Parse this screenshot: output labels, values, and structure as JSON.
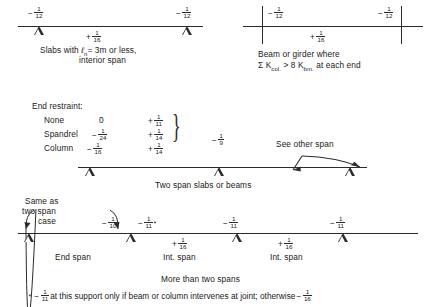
{
  "figure": {
    "type": "aci-moment-coefficient-diagram",
    "panels": [
      {
        "id": "slabs-interior",
        "caption_line1": "Slabs with ℓn = 3m or less,",
        "caption_line2": "interior span",
        "caption_italic_symbol": "ℓ",
        "caption_subscript": "n",
        "left_moment": {
          "sign": "−",
          "num": "1",
          "den": "12"
        },
        "right_moment": {
          "sign": "−",
          "num": "1",
          "den": "12"
        },
        "mid_moment": {
          "sign": "+",
          "num": "1",
          "den": "16"
        },
        "support_type": "pin"
      },
      {
        "id": "beam-or-girder",
        "caption_line1": "Beam or girder where",
        "caption_line2_pre": "Σ K",
        "caption_line2_sub1": "col.",
        "caption_line2_mid": " > 8 K",
        "caption_line2_sub2": "bm.",
        "caption_line2_post": " at each end",
        "left_moment": {
          "sign": "−",
          "num": "1",
          "den": "12"
        },
        "right_moment": {
          "sign": "−",
          "num": "1",
          "den": "12"
        },
        "mid_moment": {
          "sign": "+",
          "num": "1",
          "den": "16"
        },
        "support_type": "column"
      }
    ],
    "two_span": {
      "heading": "End restraint:",
      "rows": [
        {
          "label": "None",
          "end_moment_zero": "0",
          "mid_moment": {
            "sign": "+",
            "num": "1",
            "den": "11"
          }
        },
        {
          "label": "Spandrel",
          "end_moment": {
            "sign": "−",
            "num": "1",
            "den": "24"
          },
          "mid_moment": {
            "sign": "+",
            "num": "1",
            "den": "14"
          }
        },
        {
          "label": "Column",
          "end_moment": {
            "sign": "−",
            "num": "1",
            "den": "16"
          },
          "mid_moment": {
            "sign": "+",
            "num": "1",
            "den": "14"
          }
        }
      ],
      "interior_support_moment": {
        "sign": "−",
        "num": "1",
        "den": "9"
      },
      "annotation": "See other span",
      "caption": "Two span slabs or beams"
    },
    "multi_span": {
      "note_line1": "Same as",
      "note_line2": "two span",
      "note_line3": "case",
      "moments": [
        {
          "sign": "−",
          "num": "1",
          "den": "10",
          "star": false
        },
        {
          "sign": "−",
          "num": "1",
          "den": "11",
          "star": true
        },
        {
          "sign": "+",
          "num": "1",
          "den": "16",
          "star": false
        },
        {
          "sign": "−",
          "num": "1",
          "den": "11",
          "star": false
        },
        {
          "sign": "+",
          "num": "1",
          "den": "16",
          "star": false
        },
        {
          "sign": "−",
          "num": "1",
          "den": "11",
          "star": false
        }
      ],
      "span_labels": [
        "End span",
        "Int. span",
        "Int. span"
      ],
      "caption": "More than two spans",
      "footnote": {
        "marker": "*",
        "sign1": "−",
        "num1": "1",
        "den1": "11",
        "text_mid": " at this support only if beam or column intervenes at joint; otherwise ",
        "sign2": "−",
        "num2": "1",
        "den2": "16"
      }
    }
  },
  "colors": {
    "ink": "#2b2b2b",
    "paper": "#ffffff"
  }
}
